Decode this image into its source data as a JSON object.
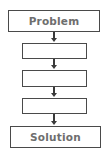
{
  "diagram": {
    "type": "flowchart",
    "direction": "top-to-bottom",
    "nodes": [
      {
        "id": "problem",
        "label": "Problem"
      },
      {
        "id": "step1",
        "label": ""
      },
      {
        "id": "step2",
        "label": ""
      },
      {
        "id": "step3",
        "label": ""
      },
      {
        "id": "solution",
        "label": "Solution"
      }
    ],
    "edges": [
      {
        "from": "problem",
        "to": "step1"
      },
      {
        "from": "step1",
        "to": "step2"
      },
      {
        "from": "step2",
        "to": "step3"
      },
      {
        "from": "step3",
        "to": "solution"
      }
    ],
    "colors": {
      "border": "#4a4a4a",
      "text": "#6e6e6e",
      "arrow": "#3a3a3a"
    }
  }
}
